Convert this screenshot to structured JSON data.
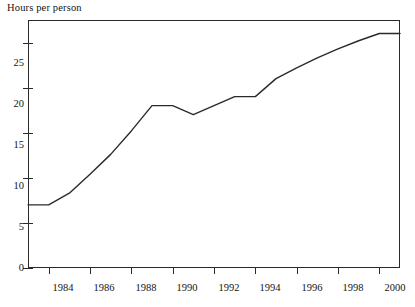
{
  "chart_data": {
    "type": "line",
    "title": "Hours per person",
    "xlabel": "",
    "ylabel": "Hours per person",
    "xlim": [
      1983,
      2001
    ],
    "ylim": [
      0,
      27.5
    ],
    "grid": false,
    "legend": "none",
    "y_ticks": [
      0,
      5,
      10,
      15,
      20,
      25
    ],
    "y_tick_labels": [
      "0",
      "5",
      "10",
      "15",
      "20",
      "25"
    ],
    "x_ticks": [
      1984,
      1986,
      1988,
      1990,
      1992,
      1994,
      1996,
      1998,
      2000
    ],
    "x_tick_labels": [
      "1984",
      "1986",
      "1988",
      "1990",
      "1992",
      "1994",
      "1996",
      "1998",
      "2000"
    ],
    "x": [
      1983,
      1984,
      1985,
      1986,
      1987,
      1988,
      1989,
      1990,
      1991,
      1992,
      1993,
      1994,
      1995,
      1996,
      1997,
      1998,
      1999,
      2000,
      2001
    ],
    "values": [
      7,
      7,
      8.3,
      10.4,
      12.6,
      15.2,
      18,
      18,
      17,
      18,
      19,
      19,
      21,
      22.2,
      23.3,
      24.3,
      25.2,
      26,
      26
    ],
    "series": [
      {
        "name": "Hours per person",
        "color": "#2b2b2b",
        "values": [
          7,
          7,
          8.3,
          10.4,
          12.6,
          15.2,
          18,
          18,
          17,
          18,
          19,
          19,
          21,
          22.2,
          23.3,
          24.3,
          25.2,
          26,
          26
        ]
      }
    ]
  },
  "axes": {
    "title": "Hours per person",
    "y_tick_labels": [
      "25",
      "20",
      "15",
      "10",
      "5",
      "0"
    ],
    "x_tick_labels": [
      "1984",
      "1986",
      "1988",
      "1990",
      "1992",
      "1994",
      "1996",
      "1998",
      "2000"
    ]
  },
  "colors": {
    "line": "#2b2b2b",
    "frame": "#2b2b2b",
    "background": "#ffffff",
    "text": "#141414"
  }
}
